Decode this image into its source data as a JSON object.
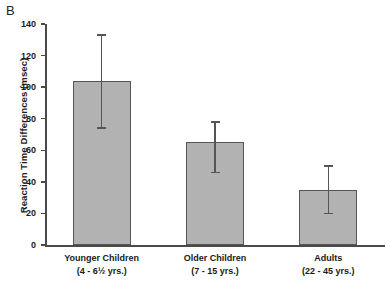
{
  "panel": {
    "label": "B"
  },
  "chart_data": {
    "type": "bar",
    "title": "",
    "xlabel": "",
    "ylabel": "Reaction Time Differences (msec)",
    "ylim": [
      0,
      140
    ],
    "yticks": [
      0,
      20,
      40,
      60,
      80,
      100,
      120,
      140
    ],
    "ytick_labels": [
      "0",
      "20",
      "40",
      "60",
      "80",
      "100",
      "120",
      "140"
    ],
    "grid": false,
    "legend": null,
    "categories": [
      "Younger Children",
      "Older Children",
      "Adults"
    ],
    "category_sublabels": [
      "(4 - 6½ yrs.)",
      "(7 - 15 yrs.)",
      "(22 - 45 yrs.)"
    ],
    "values": [
      104,
      65,
      35
    ],
    "errors_upper": [
      29,
      13,
      15
    ],
    "errors_lower": [
      30,
      19,
      15
    ],
    "bar_color": "#b2b2b2",
    "bar_edge_color": "#555555",
    "error_color": "#555555"
  }
}
